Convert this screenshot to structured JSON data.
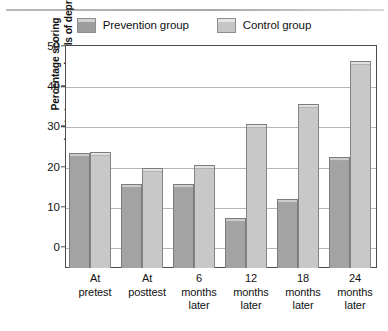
{
  "chart_data": {
    "type": "bar",
    "title": "",
    "xlabel": "",
    "ylabel": "Percentage scoring moderate to severe levels of depression",
    "ylabel_lines": [
      "Percentage scoring",
      "moderate to severe levels of depression"
    ],
    "categories": [
      "At pretest",
      "At posttest",
      "6 months later",
      "12 months later",
      "18 months later",
      "24 months later"
    ],
    "category_lines": [
      [
        "At",
        "pretest"
      ],
      [
        "At",
        "posttest"
      ],
      [
        "6",
        "months",
        "later"
      ],
      [
        "12",
        "months",
        "later"
      ],
      [
        "18",
        "months",
        "later"
      ],
      [
        "24",
        "months",
        "later"
      ]
    ],
    "series": [
      {
        "name": "Prevention group",
        "color": "#a3a3a3",
        "values": [
          23.5,
          15.7,
          15.7,
          7.2,
          11.9,
          22.4
        ]
      },
      {
        "name": "Control group",
        "color": "#c8c8c8",
        "values": [
          23.6,
          19.7,
          20.4,
          30.6,
          35.6,
          46.3
        ]
      }
    ],
    "ylim": [
      0,
      50
    ],
    "yticks": [
      0,
      10,
      20,
      30,
      40,
      50
    ],
    "ytick_labels": [
      "0",
      "10",
      "20",
      "30",
      "40",
      "50"
    ],
    "grid": true,
    "legend_position": "top-center"
  },
  "legend": {
    "entries": [
      {
        "label": "Prevention group",
        "swatch": "prevention-swatch"
      },
      {
        "label": "Control group",
        "swatch": "control-swatch"
      }
    ]
  }
}
